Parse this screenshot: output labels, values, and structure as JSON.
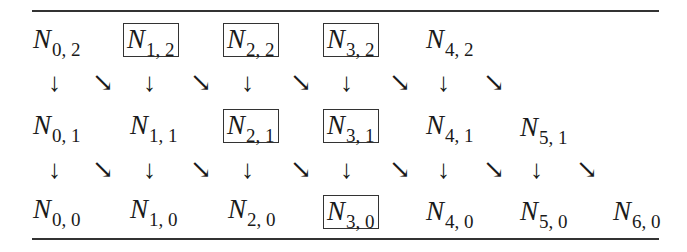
{
  "diagram": {
    "rows": [
      {
        "level": 2,
        "nodes": [
          {
            "label": "N",
            "sub": "0, 2",
            "boxed": false
          },
          {
            "label": "N",
            "sub": "1, 2",
            "boxed": true
          },
          {
            "label": "N",
            "sub": "2, 2",
            "boxed": true
          },
          {
            "label": "N",
            "sub": "3, 2",
            "boxed": true
          },
          {
            "label": "N",
            "sub": "4, 2",
            "boxed": false
          }
        ]
      },
      {
        "level": 1,
        "nodes": [
          {
            "label": "N",
            "sub": "0, 1",
            "boxed": false
          },
          {
            "label": "N",
            "sub": "1, 1",
            "boxed": false
          },
          {
            "label": "N",
            "sub": "2, 1",
            "boxed": true
          },
          {
            "label": "N",
            "sub": "3, 1",
            "boxed": true
          },
          {
            "label": "N",
            "sub": "4, 1",
            "boxed": false
          },
          {
            "label": "N",
            "sub": "5, 1",
            "boxed": false
          }
        ]
      },
      {
        "level": 0,
        "nodes": [
          {
            "label": "N",
            "sub": "0, 0",
            "boxed": false
          },
          {
            "label": "N",
            "sub": "1, 0",
            "boxed": false
          },
          {
            "label": "N",
            "sub": "2, 0",
            "boxed": false
          },
          {
            "label": "N",
            "sub": "3, 0",
            "boxed": true
          },
          {
            "label": "N",
            "sub": "4, 0",
            "boxed": false
          },
          {
            "label": "N",
            "sub": "5, 0",
            "boxed": false
          },
          {
            "label": "N",
            "sub": "6, 0",
            "boxed": false
          }
        ]
      }
    ],
    "arrows": {
      "down_glyph": "↓",
      "diag_glyph": "↘"
    }
  }
}
